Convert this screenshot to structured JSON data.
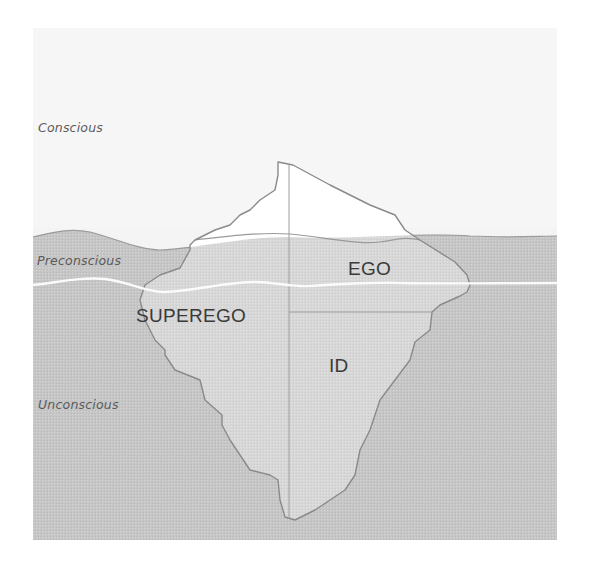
{
  "diagram": {
    "colors": {
      "background": "#ffffff",
      "sky": "#f3f3f3",
      "water": "#c9c9c9",
      "iceberg_above": "#ffffff",
      "iceberg_below": "#d8d8d8",
      "outline": "#8a8a8a",
      "divider_white": "#f7f7f7",
      "text": "#3a3a3a"
    },
    "zones": [
      {
        "id": "conscious",
        "label": "Conscious"
      },
      {
        "id": "preconscious",
        "label": "Preconscious"
      },
      {
        "id": "unconscious",
        "label": "Unconscious"
      }
    ],
    "parts": [
      {
        "id": "ego",
        "label": "EGO"
      },
      {
        "id": "superego",
        "label": "SUPEREGO"
      },
      {
        "id": "id",
        "label": "ID"
      }
    ]
  }
}
